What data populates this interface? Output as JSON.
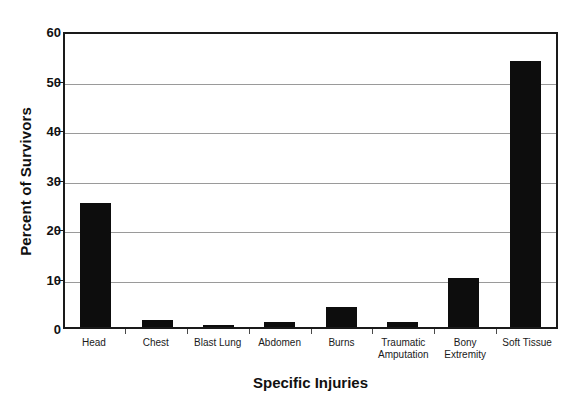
{
  "chart_data": {
    "type": "bar",
    "title": "",
    "xlabel": "Specific Injuries",
    "ylabel": "Percent of Survivors",
    "categories": [
      "Head",
      "Chest",
      "Blast Lung",
      "Abdomen",
      "Burns",
      "Traumatic Amputation",
      "Bony Extremity",
      "Soft Tissue"
    ],
    "values": [
      25,
      1.5,
      0.5,
      1,
      4,
      1,
      10,
      53.7
    ],
    "ylim": [
      0,
      60
    ],
    "yticks": [
      0,
      10,
      20,
      30,
      40,
      50,
      60
    ],
    "ytick_labels": [
      "0",
      "10",
      "20",
      "30",
      "40",
      "50",
      "60"
    ],
    "grid": "horizontal",
    "legend": "none",
    "bar_color": "#0d0d0d",
    "axis_color": "#1a1a1a",
    "gridline_color": "#9a9a9a",
    "background_color": "#ffffff"
  },
  "axis": {
    "y_title": "Percent of Survivors",
    "x_title": "Specific Injuries"
  },
  "xtick_lines": [
    {
      "line1": "Head",
      "line2": ""
    },
    {
      "line1": "Chest",
      "line2": ""
    },
    {
      "line1": "Blast Lung",
      "line2": ""
    },
    {
      "line1": "Abdomen",
      "line2": ""
    },
    {
      "line1": "Burns",
      "line2": ""
    },
    {
      "line1": "Traumatic",
      "line2": "Amputation"
    },
    {
      "line1": "Bony",
      "line2": "Extremity"
    },
    {
      "line1": "Soft Tissue",
      "line2": ""
    }
  ]
}
